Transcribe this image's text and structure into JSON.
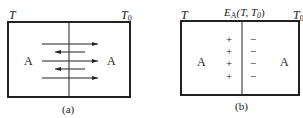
{
  "diagram_a": {
    "left_temp": "T",
    "right_temp": "T",
    "right_temp_sub": "0",
    "left_label": "A",
    "right_label": "A",
    "caption": "(a)"
  },
  "diagram_b": {
    "left_temp": "T",
    "right_temp": "T",
    "right_temp_sub": "0",
    "emf_symbol": "E",
    "emf_sub": "A",
    "emf_args": "(T, T",
    "emf_args_sub": "0",
    "emf_close": ")",
    "left_label": "A",
    "right_label": "A",
    "plus": "+",
    "minus": "−",
    "caption": "(b)"
  }
}
